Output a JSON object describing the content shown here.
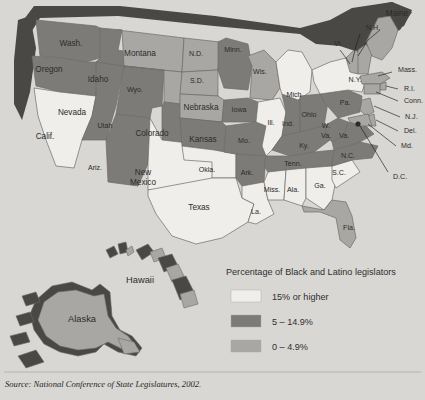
{
  "figure": {
    "source": "Source: National Conference of State Legislatures, 2002."
  },
  "legend": {
    "title": "Percentage of Black and Latino legislators",
    "items": [
      {
        "label": "15% or higher",
        "color": "#efeeea",
        "key": "high"
      },
      {
        "label": "5 – 14.9%",
        "color": "#7d7b78",
        "key": "mid"
      },
      {
        "label": "0 – 4.9%",
        "color": "#a9a7a3",
        "key": "low"
      }
    ]
  },
  "palette": {
    "background": "#d9d7d3",
    "high": "#efeeea",
    "mid": "#7d7b78",
    "low": "#a9a7a3",
    "shadow": "#4a4845",
    "border": "#6d6b68",
    "text": "#2b2b2b"
  },
  "map": {
    "inset_labels": [
      {
        "name": "Hawaii",
        "x": 140,
        "y": 281
      },
      {
        "name": "Alaska",
        "x": 82,
        "y": 320
      }
    ],
    "pointer_labels": [
      {
        "name": "N.H.",
        "x": 366,
        "y": 28
      },
      {
        "name": "Vt.",
        "x": 334,
        "y": 44
      },
      {
        "name": "Mass.",
        "x": 398,
        "y": 70
      },
      {
        "name": "R.I.",
        "x": 404,
        "y": 89
      },
      {
        "name": "Conn.",
        "x": 404,
        "y": 101
      },
      {
        "name": "N.J.",
        "x": 405,
        "y": 117
      },
      {
        "name": "Del.",
        "x": 404,
        "y": 131
      },
      {
        "name": "Md.",
        "x": 401,
        "y": 146
      },
      {
        "name": "D.C.",
        "x": 393,
        "y": 177
      }
    ],
    "states": [
      {
        "name": "Wash.",
        "cat": "mid",
        "lx": 71,
        "ly": 44
      },
      {
        "name": "Oregon",
        "cat": "mid",
        "lx": 49,
        "ly": 70
      },
      {
        "name": "Calif.",
        "cat": "high",
        "lx": 45,
        "ly": 137
      },
      {
        "name": "Nevada",
        "cat": "mid",
        "lx": 72,
        "ly": 113
      },
      {
        "name": "Idaho",
        "cat": "mid",
        "lx": 98,
        "ly": 80
      },
      {
        "name": "Montana",
        "cat": "low",
        "lx": 140,
        "ly": 54
      },
      {
        "name": "Wyo.",
        "cat": "low",
        "lx": 135,
        "ly": 90
      },
      {
        "name": "Utah",
        "cat": "mid",
        "lx": 105,
        "ly": 126
      },
      {
        "name": "Ariz.",
        "cat": "mid",
        "lx": 95,
        "ly": 168
      },
      {
        "name": "Colorado",
        "cat": "mid",
        "lx": 152,
        "ly": 134
      },
      {
        "name": "New Mexico",
        "cat": "high",
        "lx": 143,
        "ly": 178
      },
      {
        "name": "N.D.",
        "cat": "low",
        "lx": 196,
        "ly": 54
      },
      {
        "name": "S.D.",
        "cat": "low",
        "lx": 197,
        "ly": 81
      },
      {
        "name": "Nebraska",
        "cat": "low",
        "lx": 201,
        "ly": 108
      },
      {
        "name": "Kansas",
        "cat": "mid",
        "lx": 203,
        "ly": 140
      },
      {
        "name": "Okla.",
        "cat": "high",
        "lx": 207,
        "ly": 170
      },
      {
        "name": "Texas",
        "cat": "high",
        "lx": 199,
        "ly": 208
      },
      {
        "name": "Minn.",
        "cat": "mid",
        "lx": 233,
        "ly": 50
      },
      {
        "name": "Iowa",
        "cat": "mid",
        "lx": 239,
        "ly": 110
      },
      {
        "name": "Mo.",
        "cat": "mid",
        "lx": 244,
        "ly": 141
      },
      {
        "name": "Ark.",
        "cat": "mid",
        "lx": 247,
        "ly": 173
      },
      {
        "name": "La.",
        "cat": "high",
        "lx": 256,
        "ly": 212
      },
      {
        "name": "Wis.",
        "cat": "low",
        "lx": 260,
        "ly": 72
      },
      {
        "name": "Ill.",
        "cat": "high",
        "lx": 271,
        "ly": 123
      },
      {
        "name": "Ind.",
        "cat": "mid",
        "lx": 288,
        "ly": 124
      },
      {
        "name": "Mich",
        "cat": "high",
        "lx": 294,
        "ly": 95
      },
      {
        "name": "Ohio",
        "cat": "mid",
        "lx": 309,
        "ly": 115
      },
      {
        "name": "Ky.",
        "cat": "mid",
        "lx": 304,
        "ly": 146
      },
      {
        "name": "Tenn.",
        "cat": "mid",
        "lx": 293,
        "ly": 164
      },
      {
        "name": "Miss.",
        "cat": "high",
        "lx": 272,
        "ly": 190
      },
      {
        "name": "Ala.",
        "cat": "high",
        "lx": 293,
        "ly": 190
      },
      {
        "name": "Ga.",
        "cat": "high",
        "lx": 320,
        "ly": 186
      },
      {
        "name": "Fla.",
        "cat": "low",
        "lx": 349,
        "ly": 228
      },
      {
        "name": "S.C.",
        "cat": "high",
        "lx": 339,
        "ly": 173
      },
      {
        "name": "N.C.",
        "cat": "mid",
        "lx": 348,
        "ly": 156
      },
      {
        "name": "W. Va.",
        "cat": "mid",
        "lx": 326,
        "ly": 131
      },
      {
        "name": "Va.",
        "cat": "mid",
        "lx": 344,
        "ly": 136
      },
      {
        "name": "Pa.",
        "cat": "mid",
        "lx": 345,
        "ly": 103
      },
      {
        "name": "N.Y.",
        "cat": "high",
        "lx": 355,
        "ly": 80
      },
      {
        "name": "Maine",
        "cat": "low",
        "lx": 397,
        "ly": 14
      }
    ]
  }
}
